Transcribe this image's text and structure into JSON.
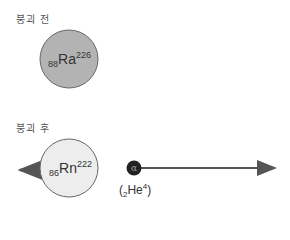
{
  "before": {
    "label": "붕괴 전",
    "nucleus": {
      "atomic_number": "88",
      "symbol": "Ra",
      "mass_number": "226",
      "fill": "#b3b3b3"
    }
  },
  "after": {
    "label": "붕괴 후",
    "nucleus": {
      "atomic_number": "86",
      "symbol": "Rn",
      "mass_number": "222",
      "fill": "#ededed"
    },
    "alpha": {
      "symbol": "α",
      "label_open": "(",
      "atomic_number": "2",
      "element": "He",
      "mass_number": "4",
      "label_close": ")",
      "fill": "#222222"
    }
  }
}
